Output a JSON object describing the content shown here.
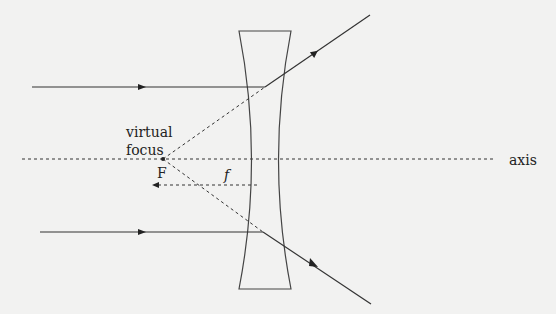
{
  "diagram": {
    "labels": {
      "virtual_line1": "virtual",
      "virtual_line2": "focus",
      "focal_point": "F",
      "focal_length": "f",
      "axis": "axis"
    },
    "colors": {
      "background": "#f2f2f1",
      "ink": "#333333"
    }
  }
}
